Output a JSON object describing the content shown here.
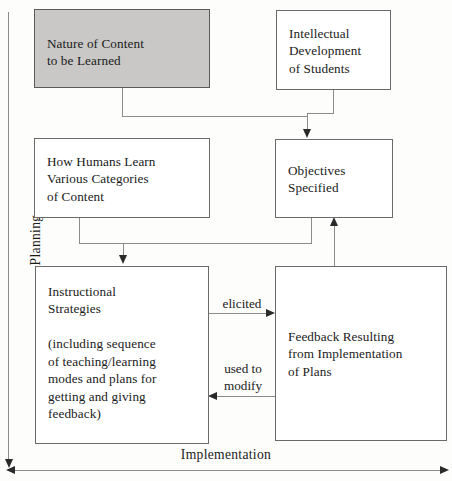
{
  "diagram": {
    "axes": {
      "vertical_label": "Planning",
      "horizontal_label": "Implementation"
    },
    "colors": {
      "shaded_box_fill": "#c9c8c6",
      "box_border": "#6a6a6a",
      "connector": "#8c8c8c",
      "arrowhead": "#2a2a2a",
      "background": "#fdfdfc",
      "text": "#1a1a1a"
    },
    "nodes": [
      {
        "id": "nature-of-content",
        "text": "Nature of Content\nto be Learned",
        "shaded": true
      },
      {
        "id": "intellectual-development",
        "text": "Intellectual\nDevelopment\nof Students",
        "shaded": false
      },
      {
        "id": "how-humans-learn",
        "text": "How Humans Learn\nVarious Categories\nof Content",
        "shaded": false
      },
      {
        "id": "objectives-specified",
        "text": "Objectives\nSpecified",
        "shaded": false
      },
      {
        "id": "instructional-strategies",
        "text": "Instructional\nStrategies\n\n(including sequence\nof teaching/learning\nmodes and plans for\ngetting and giving\nfeedback)",
        "shaded": false
      },
      {
        "id": "feedback-resulting",
        "text": "Feedback Resulting\nfrom Implementation\nof Plans",
        "shaded": false
      }
    ],
    "edge_labels": {
      "elicited": "elicited",
      "used_to_modify": "used to\nmodify"
    }
  }
}
